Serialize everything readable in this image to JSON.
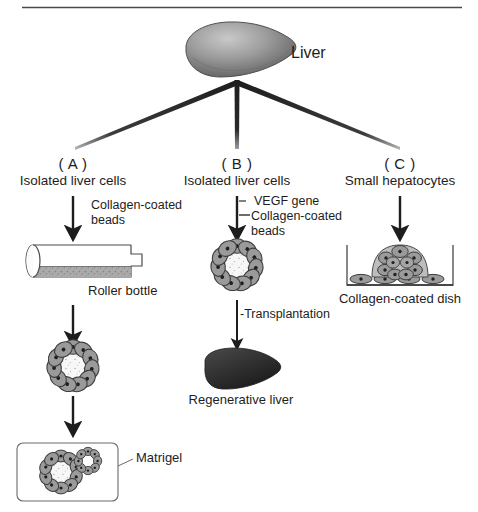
{
  "figure": {
    "source_label": "Liver",
    "top_rule": true,
    "sections": [
      {
        "id": "A",
        "letter": "( A )",
        "title": "Isolated liver cells",
        "steps": [
          {
            "name": "step-additive",
            "text": "Collagen-coated\nbeads"
          },
          {
            "name": "vessel",
            "text": "Roller bottle"
          },
          {
            "name": "spheroid",
            "text": ""
          },
          {
            "name": "matrix",
            "text": "Matrigel"
          }
        ],
        "additive_line1": "Collagen-coated",
        "additive_line2": "beads",
        "vessel_label": "Roller bottle",
        "matrix_label": "Matrigel"
      },
      {
        "id": "B",
        "letter": "( B )",
        "title": "Isolated liver cells",
        "additive_line1": "VEGF gene",
        "additive_line2": "Collagen-coated",
        "additive_line3": "beads",
        "additive_bullet1": "·",
        "additive_bullet2": "←",
        "transfer_label": "-Transplantation",
        "result_label": "Regenerative liver"
      },
      {
        "id": "C",
        "letter": "( C )",
        "title": "Small hepatocytes",
        "dish_label": "Collagen-coated dish"
      }
    ],
    "colors": {
      "ink": "#1d1d1d",
      "line": "#3a3a3a",
      "cell_fill": "#9a9a9a",
      "cell_stroke": "#3c3c3c",
      "nucleus": "#1f1f1f",
      "core_fill": "#f7f7f7",
      "liver_top": "#8d8d8d",
      "liver_bottom": "#2e2e2e",
      "sediment": "#a8a8a8",
      "vessel_stroke": "#4a4a4a"
    }
  }
}
